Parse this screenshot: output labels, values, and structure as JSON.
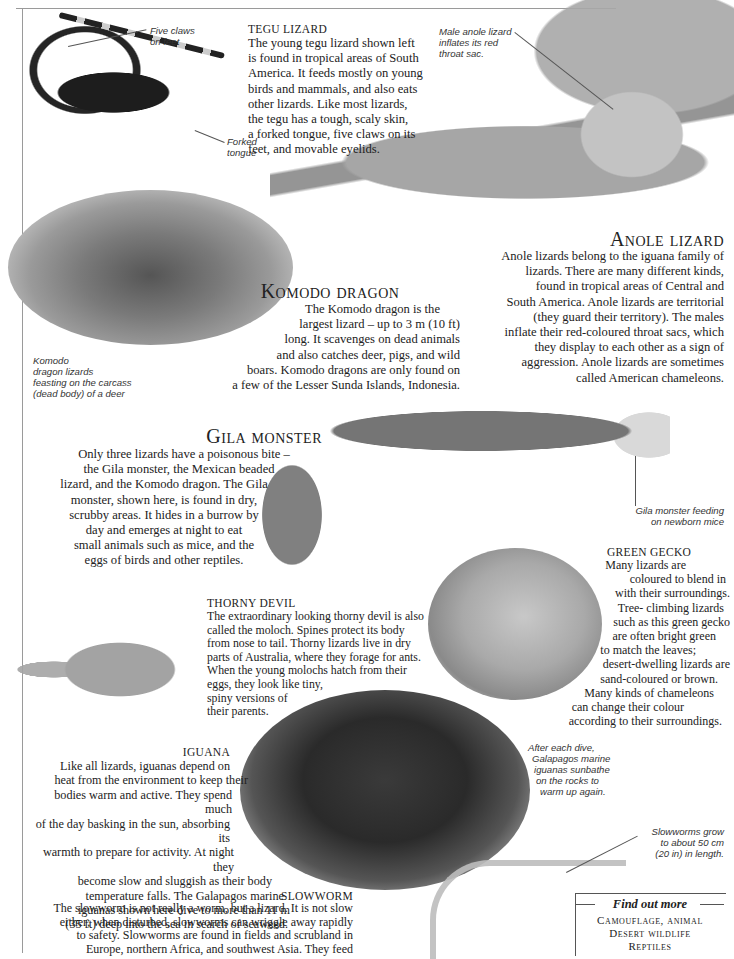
{
  "page": {
    "header_text": "LIZARDS"
  },
  "tegu": {
    "title": "TEGU LIZARD",
    "lines": [
      "The young tegu lizard shown left",
      "is found in tropical areas of South",
      "America. It feeds mostly on young",
      "birds and mammals, and also eats",
      "other lizards. Like most lizards,",
      "the tegu has a tough, scaly skin,",
      "a forked tongue, five claws on its",
      "feet, and movable eyelids."
    ],
    "caption_claws": [
      "Five claws",
      "on feet"
    ],
    "caption_tongue": [
      "Forked",
      "tongue"
    ]
  },
  "anole": {
    "caption": [
      "Male anole lizard",
      "inflates its red",
      "throat sac."
    ],
    "title": "Anole lizard",
    "lines": [
      "Anole lizards belong to the iguana family of",
      "lizards. There are many different kinds,",
      "found in tropical areas of Central and",
      "South America. Anole lizards are territorial",
      "(they guard their territory). The males",
      "inflate their red-coloured throat sacs, which",
      "they display to each other as a sign of",
      "aggression. Anole lizards are sometimes",
      "called American chameleons."
    ]
  },
  "komodo": {
    "title": "Komodo dragon",
    "lines": [
      "The Komodo dragon is the",
      "largest lizard – up to 3 m (10 ft)",
      "long. It scavenges on dead animals",
      "and also catches deer, pigs, and wild",
      "boars. Komodo dragons are only found on",
      "a few of the Lesser Sunda Islands, Indonesia."
    ],
    "caption": [
      "Komodo",
      "dragon lizards",
      "feasting on the carcass",
      "(dead body) of a deer"
    ]
  },
  "gila": {
    "title": "Gila monster",
    "lines": [
      "Only three lizards have a poisonous bite –",
      "the Gila monster, the Mexican beaded",
      "lizard, and the Komodo dragon. The Gila",
      "monster, shown here, is found in dry,",
      "scrubby areas. It hides in a burrow by",
      "day and emerges at night to eat",
      "small animals such as mice, and the",
      "eggs of birds and other reptiles."
    ],
    "caption": [
      "Gila monster feeding",
      "on newborn mice"
    ]
  },
  "gecko": {
    "title": "GREEN GECKO",
    "lines": [
      "Many lizards are",
      "coloured to blend in",
      "with their surroundings.",
      "Tree- climbing lizards",
      "such as this green gecko",
      "are often bright green",
      "to match the leaves;",
      "desert-dwelling lizards are",
      "sand-coloured or brown.",
      "Many kinds of chameleons",
      "can change their colour",
      "according to their surroundings."
    ]
  },
  "thorny": {
    "title": "THORNY DEVIL",
    "lines": [
      "The extraordinary looking thorny devil is also",
      "called the moloch. Spines protect its body",
      "from nose to tail. Thorny lizards live in dry",
      "parts of Australia, where they forage for ants.",
      "When the young molochs hatch from their",
      "eggs, they look like tiny,",
      "spiny versions of",
      "their parents."
    ]
  },
  "iguana": {
    "title": "IGUANA",
    "lines": [
      "Like all lizards, iguanas depend on",
      "heat from the environment to keep their",
      "bodies warm and active. They spend much",
      "of the day basking in the sun, absorbing its",
      "warmth to prepare for activity. At night they",
      "become slow and sluggish as their body",
      "temperature falls. The Galapagos marine",
      "iguanas shown here dive to more than 11 m",
      "(35 ft) deep into the sea in search of seaweed."
    ],
    "caption": [
      "After each dive,",
      "Galapagos marine",
      "iguanas sunbathe",
      "on the rocks to",
      "warm up again."
    ]
  },
  "slowworm": {
    "title": "SLOWWORM",
    "lines": [
      "The slowworm is not really a worm, but a lizard. It is not slow",
      "either; when disturbed, slowworms can wriggle away rapidly",
      "to safety. Slowworms are found in fields and scrubland in",
      "Europe, northern Africa, and southwest Asia. They feed"
    ],
    "caption": [
      "Slowworms grow",
      "to about 50 cm",
      "(20 in) in length."
    ]
  },
  "find_out_more": {
    "title": "Find out more",
    "items": [
      "Camouflage, animal",
      "Desert wildlife",
      "Reptiles"
    ]
  }
}
